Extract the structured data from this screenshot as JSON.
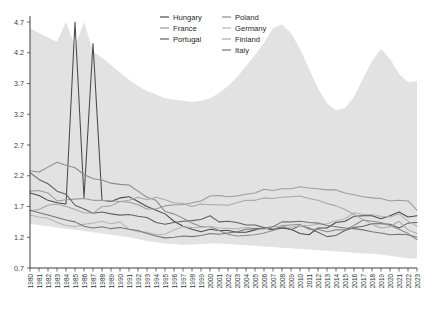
{
  "chart_data": {
    "type": "line",
    "title": "",
    "xlabel": "",
    "ylabel": "",
    "ylim": [
      0.7,
      4.7
    ],
    "ytick_values": [
      0.7,
      1.2,
      1.7,
      2.2,
      2.7,
      3.2,
      3.7,
      4.2,
      4.7
    ],
    "ytick_labels": [
      "0.7",
      "1.2",
      "1.7",
      "2.2",
      "2.7",
      "3.2",
      "3.7",
      "4.2",
      "4.7"
    ],
    "grid": false,
    "legend_position": "top-center",
    "x": [
      1980,
      1981,
      1982,
      1983,
      1984,
      1985,
      1986,
      1987,
      1988,
      1989,
      1990,
      1991,
      1992,
      1993,
      1994,
      1995,
      1996,
      1997,
      1998,
      1999,
      2000,
      2001,
      2002,
      2003,
      2004,
      2005,
      2006,
      2007,
      2008,
      2009,
      2010,
      2011,
      2012,
      2013,
      2014,
      2015,
      2016,
      2017,
      2018,
      2019,
      2020,
      2021,
      2022,
      2023
    ],
    "categories": [
      "1980",
      "1981",
      "1982",
      "1983",
      "1984",
      "1985",
      "1986",
      "1987",
      "1988",
      "1989",
      "1990",
      "1991",
      "1992",
      "1993",
      "1994",
      "1995",
      "1996",
      "1997",
      "1998",
      "1999",
      "2000",
      "2001",
      "2002",
      "2003",
      "2004",
      "2005",
      "2006",
      "2007",
      "2008",
      "2009",
      "2010",
      "2011",
      "2012",
      "2013",
      "2014",
      "2015",
      "2016",
      "2017",
      "2018",
      "2019",
      "2020",
      "2021",
      "2022",
      "2023"
    ],
    "band": {
      "name": "min-max range",
      "color": "#e2e2e2",
      "upper": [
        4.6,
        4.52,
        4.45,
        4.38,
        4.95,
        4.3,
        4.88,
        4.22,
        4.12,
        4.0,
        3.88,
        3.76,
        3.66,
        3.58,
        3.52,
        3.46,
        3.44,
        3.42,
        3.4,
        3.42,
        3.46,
        3.54,
        3.66,
        3.8,
        3.98,
        4.16,
        4.36,
        4.6,
        4.66,
        4.52,
        4.26,
        3.94,
        3.62,
        3.38,
        3.26,
        3.3,
        3.48,
        3.78,
        4.06,
        4.26,
        4.1,
        3.86,
        3.72,
        3.74
      ],
      "lower": [
        1.42,
        1.4,
        1.38,
        1.36,
        1.34,
        1.32,
        1.3,
        1.28,
        1.26,
        1.24,
        1.22,
        1.2,
        1.17,
        1.14,
        1.12,
        1.1,
        1.09,
        1.08,
        1.08,
        1.09,
        1.1,
        1.1,
        1.09,
        1.08,
        1.07,
        1.06,
        1.05,
        1.04,
        1.03,
        1.02,
        1.01,
        1.0,
        0.99,
        0.98,
        0.97,
        0.96,
        0.95,
        0.94,
        0.93,
        0.92,
        0.9,
        0.88,
        0.86,
        0.85
      ]
    },
    "series": [
      {
        "name": "Hungary",
        "color": "#4a4a4a",
        "values": [
          1.92,
          1.88,
          1.8,
          1.76,
          1.74,
          4.9,
          1.84,
          4.35,
          1.8,
          1.78,
          1.84,
          1.86,
          1.78,
          1.7,
          1.64,
          1.58,
          1.46,
          1.38,
          1.33,
          1.29,
          1.33,
          1.31,
          1.31,
          1.28,
          1.28,
          1.32,
          1.35,
          1.32,
          1.35,
          1.33,
          1.26,
          1.24,
          1.35,
          1.35,
          1.44,
          1.46,
          1.54,
          1.55,
          1.55,
          1.5,
          1.55,
          1.61,
          1.53,
          1.55
        ]
      },
      {
        "name": "France",
        "color": "#9c9c9c",
        "values": [
          1.95,
          1.96,
          1.92,
          1.79,
          1.81,
          1.82,
          1.83,
          1.8,
          1.8,
          1.79,
          1.78,
          1.77,
          1.73,
          1.66,
          1.66,
          1.71,
          1.73,
          1.73,
          1.76,
          1.79,
          1.87,
          1.88,
          1.86,
          1.87,
          1.9,
          1.92,
          1.98,
          1.96,
          1.99,
          1.99,
          2.02,
          2.0,
          1.99,
          1.97,
          1.97,
          1.92,
          1.89,
          1.86,
          1.84,
          1.83,
          1.79,
          1.8,
          1.79,
          1.64
        ]
      },
      {
        "name": "Portugal",
        "color": "#616161",
        "values": [
          2.25,
          2.14,
          2.07,
          1.95,
          1.9,
          1.72,
          1.66,
          1.59,
          1.61,
          1.58,
          1.56,
          1.57,
          1.54,
          1.52,
          1.44,
          1.41,
          1.44,
          1.46,
          1.47,
          1.49,
          1.55,
          1.45,
          1.46,
          1.44,
          1.4,
          1.4,
          1.36,
          1.33,
          1.37,
          1.32,
          1.39,
          1.35,
          1.28,
          1.21,
          1.23,
          1.31,
          1.36,
          1.38,
          1.42,
          1.42,
          1.41,
          1.35,
          1.43,
          1.44
        ]
      },
      {
        "name": "Poland",
        "color": "#8d8d8d",
        "values": [
          2.28,
          2.26,
          2.34,
          2.42,
          2.37,
          2.33,
          2.22,
          2.15,
          2.13,
          2.08,
          2.06,
          2.05,
          1.95,
          1.85,
          1.8,
          1.62,
          1.58,
          1.51,
          1.43,
          1.37,
          1.37,
          1.31,
          1.25,
          1.22,
          1.23,
          1.24,
          1.27,
          1.31,
          1.39,
          1.4,
          1.41,
          1.33,
          1.33,
          1.29,
          1.32,
          1.32,
          1.39,
          1.48,
          1.46,
          1.44,
          1.39,
          1.33,
          1.26,
          1.16
        ]
      },
      {
        "name": "Germany",
        "color": "#b5b5b5",
        "values": [
          1.56,
          1.53,
          1.51,
          1.44,
          1.39,
          1.37,
          1.41,
          1.43,
          1.46,
          1.42,
          1.45,
          1.33,
          1.29,
          1.28,
          1.24,
          1.25,
          1.32,
          1.37,
          1.36,
          1.36,
          1.38,
          1.35,
          1.34,
          1.34,
          1.36,
          1.34,
          1.33,
          1.37,
          1.38,
          1.36,
          1.39,
          1.39,
          1.41,
          1.42,
          1.47,
          1.5,
          1.6,
          1.57,
          1.57,
          1.54,
          1.53,
          1.58,
          1.46,
          1.38
        ]
      },
      {
        "name": "Finland",
        "color": "#a8a8a8",
        "values": [
          1.63,
          1.65,
          1.72,
          1.74,
          1.7,
          1.65,
          1.6,
          1.59,
          1.7,
          1.71,
          1.78,
          1.8,
          1.85,
          1.81,
          1.85,
          1.81,
          1.76,
          1.75,
          1.7,
          1.74,
          1.73,
          1.73,
          1.72,
          1.76,
          1.8,
          1.8,
          1.84,
          1.83,
          1.85,
          1.86,
          1.87,
          1.83,
          1.8,
          1.75,
          1.71,
          1.65,
          1.57,
          1.49,
          1.41,
          1.35,
          1.37,
          1.46,
          1.32,
          1.26
        ]
      },
      {
        "name": "Italy",
        "color": "#757575",
        "values": [
          1.64,
          1.6,
          1.56,
          1.52,
          1.48,
          1.45,
          1.38,
          1.35,
          1.37,
          1.34,
          1.36,
          1.33,
          1.31,
          1.26,
          1.22,
          1.19,
          1.2,
          1.22,
          1.21,
          1.23,
          1.26,
          1.25,
          1.27,
          1.29,
          1.33,
          1.34,
          1.35,
          1.37,
          1.45,
          1.45,
          1.46,
          1.44,
          1.43,
          1.39,
          1.37,
          1.35,
          1.34,
          1.32,
          1.29,
          1.27,
          1.24,
          1.25,
          1.24,
          1.2
        ]
      }
    ],
    "legend": [
      {
        "label": "Hungary",
        "color": "#4a4a4a",
        "column": 0
      },
      {
        "label": "France",
        "color": "#9c9c9c",
        "column": 0
      },
      {
        "label": "Portugal",
        "color": "#616161",
        "column": 0
      },
      {
        "label": "Poland",
        "color": "#8d8d8d",
        "column": 1
      },
      {
        "label": "Germany",
        "color": "#b5b5b5",
        "column": 1
      },
      {
        "label": "Finland",
        "color": "#a8a8a8",
        "column": 1
      },
      {
        "label": "Italy",
        "color": "#757575",
        "column": 1
      }
    ]
  }
}
